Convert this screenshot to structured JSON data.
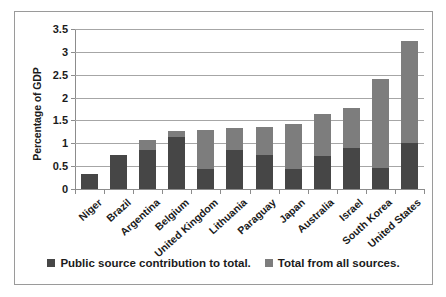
{
  "chart_data": {
    "type": "bar",
    "title": "",
    "xlabel": "",
    "ylabel": "Percentage of GDP",
    "ylim": [
      0,
      3.5
    ],
    "ytick_labels": [
      "0",
      "0.5",
      "1",
      "1.5",
      "2",
      "2.5",
      "3",
      "3.5"
    ],
    "ytick_values": [
      0,
      0.5,
      1,
      1.5,
      2,
      2.5,
      3,
      3.5
    ],
    "grid": true,
    "legend_position": "bottom",
    "stacked_overlay": true,
    "categories": [
      "Niger",
      "Brazil",
      "Argentina",
      "Belgium",
      "United Kingdom",
      "Lithuania",
      "Paraguay",
      "Japan",
      "Australia",
      "Israel",
      "South Korea",
      "United States"
    ],
    "series": [
      {
        "name": "Total from all sources.",
        "color": "#7d7d7d",
        "values": [
          0.33,
          0.75,
          1.07,
          1.26,
          1.29,
          1.34,
          1.35,
          1.42,
          1.64,
          1.78,
          2.4,
          3.23
        ]
      },
      {
        "name": "Public source contribution to total.",
        "color": "#464646",
        "values": [
          0.33,
          0.75,
          0.85,
          1.13,
          0.43,
          0.85,
          0.74,
          0.44,
          0.72,
          0.9,
          0.47,
          1.0
        ]
      }
    ]
  },
  "legend": {
    "items": [
      {
        "label": "Public source contribution to total.",
        "color": "#464646"
      },
      {
        "label": "Total from all sources.",
        "color": "#7d7d7d"
      }
    ]
  }
}
